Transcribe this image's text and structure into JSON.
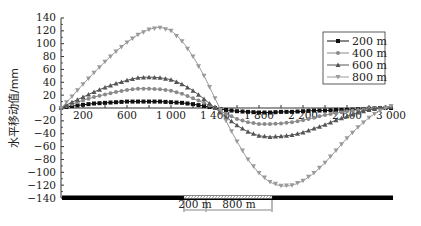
{
  "chart_data": {
    "type": "line",
    "title": "",
    "xlabel": "",
    "ylabel": "水平移动值/mm",
    "xlim": [
      0,
      3000
    ],
    "ylim": [
      -140,
      140
    ],
    "x_ticks": [
      200,
      600,
      1000,
      1400,
      1800,
      2200,
      2600,
      3000
    ],
    "x_tick_labels": [
      "200",
      "600",
      "1 000",
      "1 400",
      "1 800",
      "2 200",
      "2 600",
      "3 000"
    ],
    "y_ticks": [
      140,
      120,
      100,
      80,
      60,
      40,
      20,
      0,
      -20,
      -40,
      -60,
      -80,
      -100,
      -120,
      -140
    ],
    "y_tick_labels": [
      "140",
      "120",
      "100",
      "80",
      "60",
      "40",
      "20",
      "0",
      "-20",
      "-40",
      "-60",
      "-80",
      "-100",
      "-120",
      "-140"
    ],
    "grid": false,
    "legend_position": "upper right",
    "x": [
      0,
      100,
      200,
      300,
      400,
      500,
      600,
      700,
      800,
      900,
      1000,
      1100,
      1200,
      1300,
      1400,
      1500,
      1600,
      1700,
      1800,
      1900,
      2000,
      2100,
      2200,
      2300,
      2400,
      2500,
      2600,
      2700,
      2800,
      2900,
      3000
    ],
    "series": [
      {
        "name": "200 m",
        "marker": "square",
        "color": "#111111",
        "values": [
          0,
          3,
          5,
          7,
          8,
          9,
          10,
          10,
          10,
          10,
          9,
          8,
          6,
          3,
          0,
          -3,
          -5,
          -6,
          -7,
          -7,
          -6,
          -6,
          -5,
          -4,
          -4,
          -3,
          -3,
          -2,
          -1,
          0,
          0
        ]
      },
      {
        "name": "400 m",
        "marker": "circle",
        "color": "#8a8a8a",
        "values": [
          0,
          6,
          12,
          17,
          21,
          25,
          28,
          30,
          30,
          29,
          27,
          22,
          15,
          8,
          0,
          -9,
          -17,
          -22,
          -25,
          -25,
          -24,
          -22,
          -19,
          -15,
          -11,
          -8,
          -5,
          -3,
          -1,
          0,
          2
        ]
      },
      {
        "name": "600 m",
        "marker": "triangle",
        "color": "#555555",
        "values": [
          0,
          9,
          17,
          25,
          32,
          38,
          43,
          47,
          48,
          47,
          44,
          37,
          27,
          14,
          0,
          -14,
          -27,
          -37,
          -43,
          -45,
          -44,
          -42,
          -38,
          -32,
          -26,
          -19,
          -13,
          -7,
          -3,
          0,
          2
        ]
      },
      {
        "name": "800 m",
        "marker": "triangle-down",
        "color": "#9a9a9a",
        "values": [
          0,
          18,
          37,
          55,
          72,
          88,
          102,
          114,
          122,
          125,
          120,
          104,
          80,
          50,
          15,
          -20,
          -52,
          -80,
          -101,
          -115,
          -121,
          -120,
          -113,
          -101,
          -85,
          -66,
          -47,
          -30,
          -15,
          -4,
          3
        ]
      }
    ],
    "annotations": {
      "bar_label_1": "200 m",
      "bar_label_2": "800 m"
    }
  }
}
